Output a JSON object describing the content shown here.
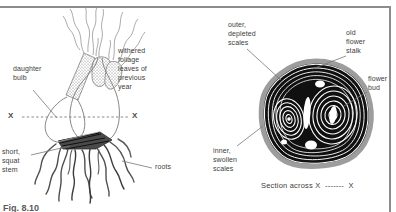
{
  "figure": {
    "fig_label": "Fig. 8.10",
    "left_panel": {
      "labels": {
        "daughter_bulb": "daughter\nbulb",
        "withered_foliage": "withered\nfoliage\nleaves of\nprevious\nyear",
        "x_left": "X",
        "x_right": "X",
        "short_squat_stem": "short,\nsquat\nstem",
        "roots": "roots"
      }
    },
    "right_panel": {
      "labels": {
        "outer_depleted_scales": "outer,\ndepleted\nscales",
        "old_flower_stalk": "old\nflower\nstalk",
        "flower_bud": "flower\nbud",
        "inner_swollen_scales": "inner,\nswollen\nscales"
      },
      "caption": "Section across X  -------  X"
    },
    "colors": {
      "frame_gray": "#8c8c8c",
      "ink": "#3d3d3d",
      "line_art_gray": "#7a7a7a",
      "section_black": "#101010",
      "rim_gray": "#9d9d9d",
      "contour_white": "#ffffff"
    }
  }
}
